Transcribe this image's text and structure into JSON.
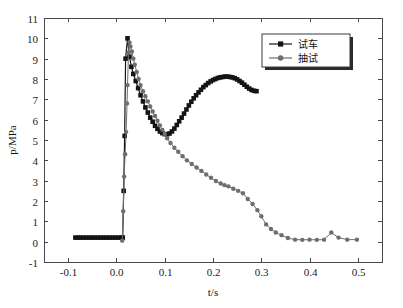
{
  "chart_data": {
    "type": "line",
    "title": "",
    "xlabel": "t/s",
    "ylabel": "p/MPa",
    "xlim": [
      -0.15,
      0.55
    ],
    "ylim": [
      -1,
      11
    ],
    "xticks": [
      -0.1,
      0.0,
      0.1,
      0.2,
      0.3,
      0.4,
      0.5
    ],
    "xtick_labels": [
      "-0.1",
      "0.0",
      "0.1",
      "0.2",
      "0.3",
      "0.4",
      "0.5"
    ],
    "yticks": [
      -1,
      0,
      1,
      2,
      3,
      4,
      5,
      6,
      7,
      8,
      9,
      10,
      11
    ],
    "ytick_labels": [
      "-1",
      "0",
      "1",
      "2",
      "3",
      "4",
      "5",
      "6",
      "7",
      "8",
      "9",
      "10",
      "11"
    ],
    "grid": false,
    "legend_position": "top-right",
    "series": [
      {
        "name": "试车",
        "color": "#141414",
        "marker": "square",
        "marker_size": 4.6,
        "line_width": 1.2,
        "points": [
          [
            -0.085,
            0.2
          ],
          [
            -0.08,
            0.2
          ],
          [
            -0.074,
            0.2
          ],
          [
            -0.068,
            0.2
          ],
          [
            -0.062,
            0.2
          ],
          [
            -0.056,
            0.2
          ],
          [
            -0.05,
            0.2
          ],
          [
            -0.044,
            0.2
          ],
          [
            -0.038,
            0.2
          ],
          [
            -0.032,
            0.2
          ],
          [
            -0.026,
            0.2
          ],
          [
            -0.02,
            0.2
          ],
          [
            -0.014,
            0.2
          ],
          [
            -0.008,
            0.2
          ],
          [
            -0.002,
            0.2
          ],
          [
            0.004,
            0.2
          ],
          [
            0.01,
            0.2
          ],
          [
            0.013,
            0.2
          ],
          [
            0.015,
            2.5
          ],
          [
            0.017,
            5.2
          ],
          [
            0.019,
            9.0
          ],
          [
            0.023,
            10.0
          ],
          [
            0.027,
            9.1
          ],
          [
            0.031,
            8.6
          ],
          [
            0.035,
            8.25
          ],
          [
            0.04,
            7.9
          ],
          [
            0.045,
            7.55
          ],
          [
            0.05,
            7.2
          ],
          [
            0.055,
            6.9
          ],
          [
            0.06,
            6.6
          ],
          [
            0.065,
            6.35
          ],
          [
            0.07,
            6.1
          ],
          [
            0.075,
            5.9
          ],
          [
            0.08,
            5.7
          ],
          [
            0.085,
            5.55
          ],
          [
            0.09,
            5.42
          ],
          [
            0.095,
            5.34
          ],
          [
            0.1,
            5.29
          ],
          [
            0.105,
            5.28
          ],
          [
            0.11,
            5.32
          ],
          [
            0.115,
            5.42
          ],
          [
            0.12,
            5.56
          ],
          [
            0.125,
            5.74
          ],
          [
            0.13,
            5.92
          ],
          [
            0.135,
            6.1
          ],
          [
            0.14,
            6.3
          ],
          [
            0.145,
            6.5
          ],
          [
            0.15,
            6.7
          ],
          [
            0.155,
            6.88
          ],
          [
            0.16,
            7.05
          ],
          [
            0.165,
            7.2
          ],
          [
            0.17,
            7.34
          ],
          [
            0.175,
            7.47
          ],
          [
            0.18,
            7.6
          ],
          [
            0.185,
            7.7
          ],
          [
            0.19,
            7.8
          ],
          [
            0.195,
            7.88
          ],
          [
            0.2,
            7.95
          ],
          [
            0.205,
            8.0
          ],
          [
            0.21,
            8.05
          ],
          [
            0.215,
            8.08
          ],
          [
            0.22,
            8.1
          ],
          [
            0.225,
            8.12
          ],
          [
            0.23,
            8.12
          ],
          [
            0.235,
            8.1
          ],
          [
            0.24,
            8.08
          ],
          [
            0.245,
            8.04
          ],
          [
            0.25,
            7.98
          ],
          [
            0.255,
            7.9
          ],
          [
            0.26,
            7.82
          ],
          [
            0.265,
            7.72
          ],
          [
            0.27,
            7.62
          ],
          [
            0.275,
            7.53
          ],
          [
            0.28,
            7.46
          ],
          [
            0.285,
            7.42
          ],
          [
            0.29,
            7.4
          ]
        ]
      },
      {
        "name": "抽试",
        "color": "#6e6e6e",
        "marker": "circle",
        "marker_size": 4.4,
        "line_width": 1.0,
        "points": [
          [
            0.012,
            0.05
          ],
          [
            0.014,
            1.5
          ],
          [
            0.016,
            3.2
          ],
          [
            0.018,
            4.3
          ],
          [
            0.02,
            5.4
          ],
          [
            0.022,
            6.8
          ],
          [
            0.023,
            7.7
          ],
          [
            0.025,
            9.3
          ],
          [
            0.027,
            9.8
          ],
          [
            0.029,
            9.6
          ],
          [
            0.032,
            9.35
          ],
          [
            0.035,
            9.0
          ],
          [
            0.038,
            8.7
          ],
          [
            0.042,
            8.35
          ],
          [
            0.046,
            8.0
          ],
          [
            0.05,
            7.7
          ],
          [
            0.055,
            7.4
          ],
          [
            0.06,
            7.15
          ],
          [
            0.065,
            6.9
          ],
          [
            0.07,
            6.65
          ],
          [
            0.075,
            6.4
          ],
          [
            0.08,
            6.18
          ],
          [
            0.085,
            5.95
          ],
          [
            0.09,
            5.72
          ],
          [
            0.095,
            5.5
          ],
          [
            0.1,
            5.3
          ],
          [
            0.105,
            5.08
          ],
          [
            0.112,
            4.85
          ],
          [
            0.12,
            4.62
          ],
          [
            0.128,
            4.42
          ],
          [
            0.137,
            4.2
          ],
          [
            0.146,
            4.0
          ],
          [
            0.156,
            3.82
          ],
          [
            0.166,
            3.65
          ],
          [
            0.176,
            3.48
          ],
          [
            0.186,
            3.3
          ],
          [
            0.196,
            3.14
          ],
          [
            0.206,
            2.98
          ],
          [
            0.216,
            2.86
          ],
          [
            0.224,
            2.78
          ],
          [
            0.232,
            2.72
          ],
          [
            0.242,
            2.6
          ],
          [
            0.252,
            2.5
          ],
          [
            0.262,
            2.38
          ],
          [
            0.272,
            2.1
          ],
          [
            0.282,
            1.85
          ],
          [
            0.292,
            1.55
          ],
          [
            0.3,
            1.25
          ],
          [
            0.31,
            0.85
          ],
          [
            0.32,
            0.62
          ],
          [
            0.33,
            0.45
          ],
          [
            0.342,
            0.32
          ],
          [
            0.355,
            0.18
          ],
          [
            0.37,
            0.1
          ],
          [
            0.385,
            0.09
          ],
          [
            0.4,
            0.1
          ],
          [
            0.415,
            0.09
          ],
          [
            0.43,
            0.1
          ],
          [
            0.445,
            0.45
          ],
          [
            0.46,
            0.2
          ],
          [
            0.478,
            0.1
          ],
          [
            0.498,
            0.1
          ]
        ]
      }
    ]
  },
  "legend": {
    "items": [
      {
        "label": "试车",
        "marker": "square",
        "color": "#141414"
      },
      {
        "label": "抽试",
        "marker": "circle",
        "color": "#6e6e6e"
      }
    ]
  },
  "colors": {
    "series_1": "#141414",
    "series_2": "#6e6e6e",
    "axis": "#4a4a4a",
    "background": "#ffffff"
  }
}
